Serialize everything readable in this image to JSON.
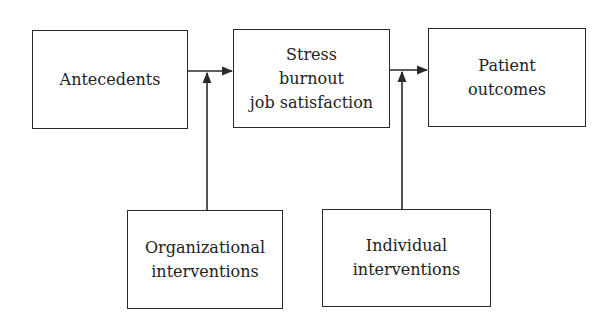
{
  "diagram": {
    "type": "flow",
    "nodes": {
      "antecedents": {
        "lines": [
          "Antecedents"
        ]
      },
      "stress": {
        "lines": [
          "Stress",
          "burnout",
          "job satisfaction"
        ]
      },
      "patient": {
        "lines": [
          "Patient",
          "outcomes"
        ]
      },
      "organizational": {
        "lines": [
          "Organizational",
          "interventions"
        ]
      },
      "individual": {
        "lines": [
          "Individual",
          "interventions"
        ]
      }
    },
    "edges": [
      {
        "from": "Antecedents",
        "to": "Stress burnout job satisfaction"
      },
      {
        "from": "Organizational interventions",
        "to": "Antecedents → Stress link"
      },
      {
        "from": "Stress burnout job satisfaction",
        "to": "Patient outcomes"
      },
      {
        "from": "Individual interventions",
        "to": "Stress → Patient outcomes link"
      }
    ],
    "colors": {
      "stroke": "#2a2a2a",
      "text": "#222222",
      "background": "#ffffff"
    }
  }
}
